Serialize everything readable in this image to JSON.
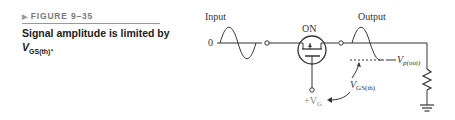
{
  "figure": {
    "number_label": "FIGURE 9–35",
    "caption_main": "Signal amplitude is limited by",
    "caption_var": "V",
    "caption_sub": "GS(th)",
    "caption_end": "."
  },
  "diagram": {
    "input_label": "Input",
    "output_label": "Output",
    "zero_label": "0",
    "state_label": "ON",
    "vp_label": "V",
    "vp_sub": "p(out)",
    "vgs_label": "V",
    "vgs_sub": "GS(th)",
    "vg_label": "+V",
    "vg_sub": "G",
    "colors": {
      "line": "#333333",
      "gate_label": "#888888"
    }
  }
}
